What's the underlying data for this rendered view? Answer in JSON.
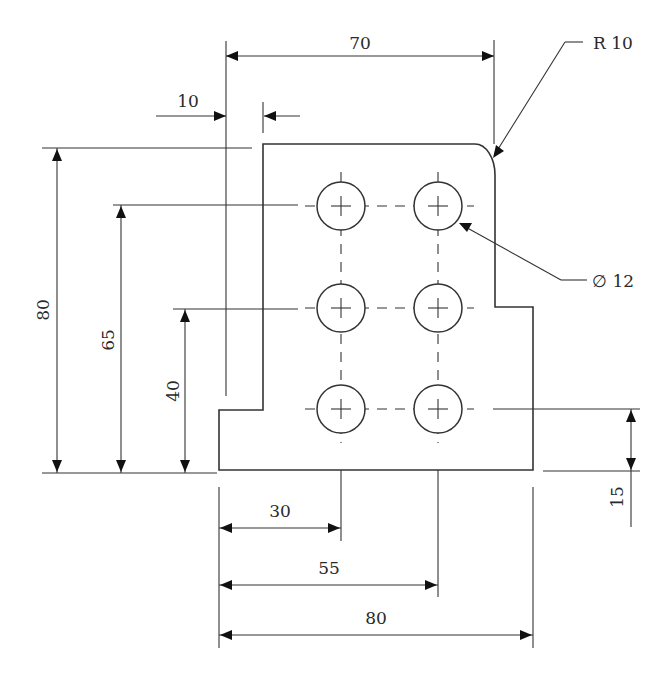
{
  "drawing": {
    "title": "Plate with six holes - orthographic dimensioned view",
    "units": "mm",
    "dimensions": {
      "overall_width": "80",
      "upper_width": "70",
      "left_offset": "10",
      "overall_height": "80",
      "hole_row_top": "65",
      "hole_row_middle": "40",
      "hole_row_bottom": "15",
      "hole_col_1": "30",
      "hole_col_2": "55",
      "fillet_radius": "R 10",
      "hole_diameter": "∅ 12"
    },
    "holes": {
      "count": 6,
      "rows": 3,
      "columns": 2,
      "diameter": "12"
    },
    "colors": {
      "line": "#333333",
      "background": "#ffffff"
    }
  }
}
